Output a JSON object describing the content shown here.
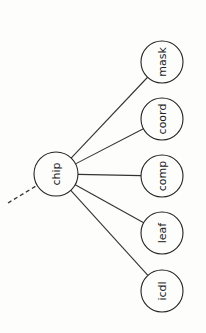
{
  "diagram": {
    "type": "tree",
    "orientation": "rotated-90-ccw",
    "root": {
      "id": "chip",
      "label": "chip",
      "cx": 56,
      "cy": 174,
      "r": 22
    },
    "incoming_edge": {
      "style": "dashed",
      "x1": 8,
      "y1": 203,
      "x2": 36,
      "y2": 186
    },
    "children": [
      {
        "id": "mask",
        "label": "mask",
        "cx": 162,
        "cy": 62,
        "r": 21
      },
      {
        "id": "coord",
        "label": "coord",
        "cx": 162,
        "cy": 119,
        "r": 21
      },
      {
        "id": "comp",
        "label": "comp",
        "cx": 162,
        "cy": 176,
        "r": 21
      },
      {
        "id": "leaf",
        "label": "leaf",
        "cx": 162,
        "cy": 233,
        "r": 21
      },
      {
        "id": "icdl",
        "label": "icdl",
        "cx": 162,
        "cy": 291,
        "r": 21
      }
    ]
  }
}
